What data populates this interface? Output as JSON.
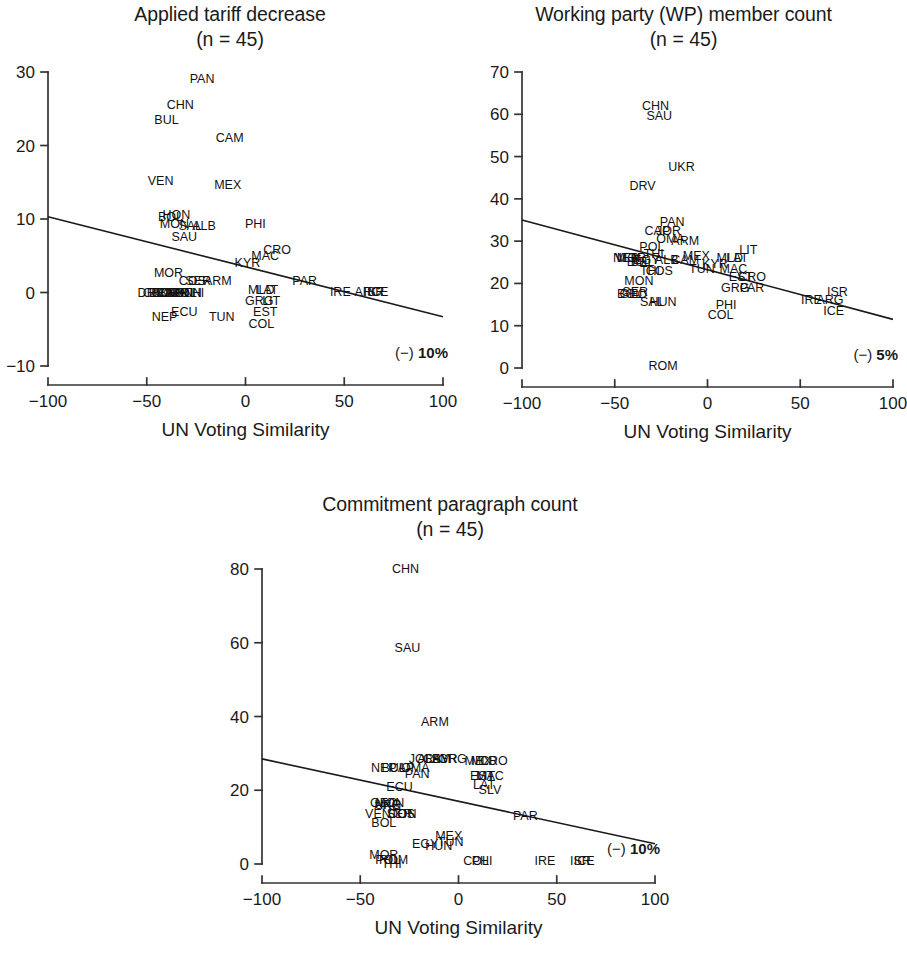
{
  "figure": {
    "axis_title": "UN Voting Similarity",
    "sample_note": "(n = 45)"
  },
  "chart_data": [
    {
      "id": "applied-tariff-decrease",
      "type": "scatter",
      "title": "Applied tariff decrease",
      "subtitle": "(n = 45)",
      "xlabel": "UN Voting Similarity",
      "ylabel": "",
      "xlim": [
        -100,
        100
      ],
      "ylim": [
        -10,
        30
      ],
      "xticks": [
        -100,
        -50,
        0,
        50,
        100
      ],
      "xtick_labels": [
        "−100",
        "−50",
        "0",
        "50",
        "100"
      ],
      "yticks": [
        -10,
        0,
        10,
        20,
        30
      ],
      "ytick_labels": [
        "−10",
        "0",
        "10",
        "20",
        "30"
      ],
      "grid": false,
      "legend": "none",
      "annotation": "(−) 10%",
      "annotation_prefix": "(−) ",
      "annotation_value": "10%",
      "trendline": {
        "x0": -100,
        "y0": 10.3,
        "x1": 100,
        "y1": -3.3
      },
      "points": [
        {
          "label": "PAN",
          "x": -22,
          "y": 29.0
        },
        {
          "label": "CHN",
          "x": -33,
          "y": 25.5
        },
        {
          "label": "BUL",
          "x": -40,
          "y": 23.5
        },
        {
          "label": "CAM",
          "x": -8,
          "y": 21.0
        },
        {
          "label": "VEN",
          "x": -43,
          "y": 15.2
        },
        {
          "label": "MEX",
          "x": -9,
          "y": 14.6
        },
        {
          "label": "BOL",
          "x": -38,
          "y": 10.3
        },
        {
          "label": "HON",
          "x": -35,
          "y": 10.5
        },
        {
          "label": "MON",
          "x": -36,
          "y": 9.3
        },
        {
          "label": "SAL",
          "x": -28,
          "y": 9.0
        },
        {
          "label": "ALB",
          "x": -21,
          "y": 9.0
        },
        {
          "label": "PHI",
          "x": 5,
          "y": 9.3
        },
        {
          "label": "SAU",
          "x": -31,
          "y": 7.5
        },
        {
          "label": "CRO",
          "x": 16,
          "y": 5.8
        },
        {
          "label": "MAC",
          "x": 10,
          "y": 5.0
        },
        {
          "label": "KYR",
          "x": 1,
          "y": 4.0
        },
        {
          "label": "MOR",
          "x": -39,
          "y": 2.6
        },
        {
          "label": "COS",
          "x": -27,
          "y": 1.5
        },
        {
          "label": "SER",
          "x": -24,
          "y": 1.5
        },
        {
          "label": "ARM",
          "x": -14,
          "y": 1.5
        },
        {
          "label": "PAR",
          "x": 30,
          "y": 1.5
        },
        {
          "label": "DRV",
          "x": -48,
          "y": 0.0
        },
        {
          "label": "GEO",
          "x": -45,
          "y": 0.0
        },
        {
          "label": "BEL",
          "x": -43,
          "y": 0.0
        },
        {
          "label": "UKR",
          "x": -41,
          "y": 0.0
        },
        {
          "label": "CAP",
          "x": -39,
          "y": 0.0
        },
        {
          "label": "OMA",
          "x": -37,
          "y": 0.0
        },
        {
          "label": "JOR",
          "x": -35,
          "y": 0.0
        },
        {
          "label": "TON",
          "x": -33,
          "y": 0.0
        },
        {
          "label": "POL",
          "x": -31,
          "y": 0.0
        },
        {
          "label": "HUN",
          "x": -29,
          "y": 0.0
        },
        {
          "label": "MLD",
          "x": 8,
          "y": 0.3
        },
        {
          "label": "LAT",
          "x": 11,
          "y": 0.3
        },
        {
          "label": "IRE",
          "x": 48,
          "y": 0.1
        },
        {
          "label": "ARG",
          "x": 62,
          "y": 0.1
        },
        {
          "label": "ISR",
          "x": 65,
          "y": 0.1
        },
        {
          "label": "ICE",
          "x": 67,
          "y": 0.1
        },
        {
          "label": "LIT",
          "x": 13,
          "y": -1.2
        },
        {
          "label": "GRG",
          "x": 7,
          "y": -1.2
        },
        {
          "label": "EST",
          "x": 10,
          "y": -2.6
        },
        {
          "label": "ECU",
          "x": -31,
          "y": -2.6
        },
        {
          "label": "NEP",
          "x": -41,
          "y": -3.4
        },
        {
          "label": "TUN",
          "x": -12,
          "y": -3.4
        },
        {
          "label": "COL",
          "x": 8,
          "y": -4.3
        },
        {
          "label": "THI",
          "x": -26,
          "y": 0.0
        }
      ]
    },
    {
      "id": "working-party-member-count",
      "type": "scatter",
      "title": "Working party (WP) member count",
      "subtitle": "(n = 45)",
      "xlabel": "UN Voting Similarity",
      "ylabel": "",
      "xlim": [
        -100,
        100
      ],
      "ylim": [
        0,
        70
      ],
      "xticks": [
        -100,
        -50,
        0,
        50,
        100
      ],
      "xtick_labels": [
        "−100",
        "−50",
        "0",
        "50",
        "100"
      ],
      "yticks": [
        0,
        10,
        20,
        30,
        40,
        50,
        60,
        70
      ],
      "ytick_labels": [
        "0",
        "10",
        "20",
        "30",
        "40",
        "50",
        "60",
        "70"
      ],
      "grid": false,
      "legend": "none",
      "annotation": "(−) 5%",
      "annotation_prefix": "(−) ",
      "annotation_value": "5%",
      "trendline": {
        "x0": -100,
        "y0": 35.0,
        "x1": 100,
        "y1": 11.5
      },
      "points": [
        {
          "label": "CHN",
          "x": -28,
          "y": 62.0
        },
        {
          "label": "SAU",
          "x": -26,
          "y": 59.5
        },
        {
          "label": "UKR",
          "x": -14,
          "y": 47.5
        },
        {
          "label": "DRV",
          "x": -35,
          "y": 43.0
        },
        {
          "label": "PAN",
          "x": -19,
          "y": 34.5
        },
        {
          "label": "CAP",
          "x": -27,
          "y": 32.5
        },
        {
          "label": "JOR",
          "x": -21,
          "y": 32.5
        },
        {
          "label": "OMA",
          "x": -20,
          "y": 30.5
        },
        {
          "label": "ARM",
          "x": -12,
          "y": 30.0
        },
        {
          "label": "POL",
          "x": -30,
          "y": 28.5
        },
        {
          "label": "LIT",
          "x": 22,
          "y": 28.0
        },
        {
          "label": "THI",
          "x": -29,
          "y": 27.0
        },
        {
          "label": "MEX",
          "x": -6,
          "y": 26.5
        },
        {
          "label": "VEN",
          "x": -43,
          "y": 26.0
        },
        {
          "label": "MOR",
          "x": -41,
          "y": 26.0
        },
        {
          "label": "BUL",
          "x": -37,
          "y": 25.0
        },
        {
          "label": "EGY",
          "x": -33,
          "y": 25.5
        },
        {
          "label": "ALB",
          "x": -22,
          "y": 25.5
        },
        {
          "label": "CAM",
          "x": -12,
          "y": 25.5
        },
        {
          "label": "MLD",
          "x": 12,
          "y": 26.0
        },
        {
          "label": "LAT",
          "x": 16,
          "y": 26.0
        },
        {
          "label": "KYR",
          "x": 4,
          "y": 24.5
        },
        {
          "label": "MAC",
          "x": 14,
          "y": 23.5
        },
        {
          "label": "TUN",
          "x": -3,
          "y": 23.5
        },
        {
          "label": "THI2",
          "x": -31,
          "y": 23.0
        },
        {
          "label": "COS",
          "x": -26,
          "y": 23.0
        },
        {
          "label": "EST",
          "x": 18,
          "y": 21.5
        },
        {
          "label": "CRO",
          "x": 24,
          "y": 21.5
        },
        {
          "label": "MON",
          "x": -37,
          "y": 20.5
        },
        {
          "label": "GRG",
          "x": 15,
          "y": 19.0
        },
        {
          "label": "PAR",
          "x": 24,
          "y": 19.0
        },
        {
          "label": "BOL",
          "x": -42,
          "y": 17.5
        },
        {
          "label": "SER",
          "x": -39,
          "y": 18.0
        },
        {
          "label": "ISR",
          "x": 70,
          "y": 18.0
        },
        {
          "label": "IRE",
          "x": 56,
          "y": 16.0
        },
        {
          "label": "ARG",
          "x": 66,
          "y": 16.0
        },
        {
          "label": "SAL",
          "x": -30,
          "y": 15.5
        },
        {
          "label": "HUN",
          "x": -24,
          "y": 15.5
        },
        {
          "label": "PHI",
          "x": 10,
          "y": 15.0
        },
        {
          "label": "ICE",
          "x": 68,
          "y": 13.5
        },
        {
          "label": "COL",
          "x": 7,
          "y": 12.5
        },
        {
          "label": "ROM",
          "x": -24,
          "y": 0.5
        },
        {
          "label": "GEO",
          "x": -40,
          "y": 17.5
        },
        {
          "label": "NEP",
          "x": -44,
          "y": 26.0
        },
        {
          "label": "BEL",
          "x": -35,
          "y": 25.0
        }
      ]
    },
    {
      "id": "commitment-paragraph-count",
      "type": "scatter",
      "title": "Commitment paragraph count",
      "subtitle": "(n = 45)",
      "xlabel": "UN Voting Similarity",
      "ylabel": "",
      "xlim": [
        -100,
        100
      ],
      "ylim": [
        0,
        80
      ],
      "xticks": [
        -100,
        -50,
        0,
        50,
        100
      ],
      "xtick_labels": [
        "−100",
        "−50",
        "0",
        "50",
        "100"
      ],
      "yticks": [
        0,
        20,
        40,
        60,
        80
      ],
      "ytick_labels": [
        "0",
        "20",
        "40",
        "60",
        "80"
      ],
      "grid": false,
      "legend": "none",
      "annotation": "(−) 10%",
      "annotation_prefix": "(−) ",
      "annotation_value": "10%",
      "trendline": {
        "x0": -100,
        "y0": 28.5,
        "x1": 100,
        "y1": 5.5
      },
      "points": [
        {
          "label": "CHN",
          "x": -27,
          "y": 80.0
        },
        {
          "label": "SAU",
          "x": -26,
          "y": 58.5
        },
        {
          "label": "ARM",
          "x": -12,
          "y": 38.5
        },
        {
          "label": "JOR",
          "x": -19,
          "y": 28.5
        },
        {
          "label": "ALB",
          "x": -15,
          "y": 28.5
        },
        {
          "label": "CAM",
          "x": -11,
          "y": 28.5
        },
        {
          "label": "KYR",
          "x": -7,
          "y": 28.5
        },
        {
          "label": "GRG",
          "x": -3,
          "y": 28.5
        },
        {
          "label": "MEX",
          "x": 10,
          "y": 28.0
        },
        {
          "label": "MLD",
          "x": 13,
          "y": 28.0
        },
        {
          "label": "CRO",
          "x": 18,
          "y": 28.0
        },
        {
          "label": "NEP",
          "x": -38,
          "y": 26.0
        },
        {
          "label": "BUL",
          "x": -33,
          "y": 26.0
        },
        {
          "label": "CAP",
          "x": -29,
          "y": 26.0
        },
        {
          "label": "OMA",
          "x": -22,
          "y": 26.0
        },
        {
          "label": "PAN",
          "x": -21,
          "y": 24.5
        },
        {
          "label": "EST",
          "x": 12,
          "y": 24.0
        },
        {
          "label": "LIT",
          "x": 14,
          "y": 24.0
        },
        {
          "label": "MAC",
          "x": 16,
          "y": 24.0
        },
        {
          "label": "LAT",
          "x": 13,
          "y": 21.5
        },
        {
          "label": "ECU",
          "x": -30,
          "y": 21.0
        },
        {
          "label": "SLV",
          "x": 16,
          "y": 20.0
        },
        {
          "label": "MON",
          "x": -35,
          "y": 16.5
        },
        {
          "label": "GEO",
          "x": -38,
          "y": 16.5
        },
        {
          "label": "ARG",
          "x": -36,
          "y": 16.0
        },
        {
          "label": "UKR",
          "x": -36,
          "y": 16.0
        },
        {
          "label": "VEN",
          "x": -41,
          "y": 13.5
        },
        {
          "label": "COS",
          "x": -29,
          "y": 13.5
        },
        {
          "label": "TON",
          "x": -28,
          "y": 13.5
        },
        {
          "label": "SER",
          "x": -30,
          "y": 13.5
        },
        {
          "label": "PAR",
          "x": 34,
          "y": 13.0
        },
        {
          "label": "BOL",
          "x": -38,
          "y": 11.0
        },
        {
          "label": "MEX2",
          "x": -5,
          "y": 7.5
        },
        {
          "label": "TUN",
          "x": -4,
          "y": 6.0
        },
        {
          "label": "EGY",
          "x": -17,
          "y": 5.5
        },
        {
          "label": "HUN",
          "x": -10,
          "y": 5.0
        },
        {
          "label": "MOR",
          "x": -38,
          "y": 2.5
        },
        {
          "label": "POL",
          "x": -36,
          "y": 1.0
        },
        {
          "label": "ROM",
          "x": -33,
          "y": 1.0
        },
        {
          "label": "THI",
          "x": -34,
          "y": 0.0
        },
        {
          "label": "COL",
          "x": 9,
          "y": 0.8
        },
        {
          "label": "PHI",
          "x": 12,
          "y": 0.8
        },
        {
          "label": "IRE",
          "x": 44,
          "y": 0.8
        },
        {
          "label": "ISR",
          "x": 62,
          "y": 0.8
        },
        {
          "label": "ICE",
          "x": 64,
          "y": 0.8
        }
      ]
    }
  ]
}
